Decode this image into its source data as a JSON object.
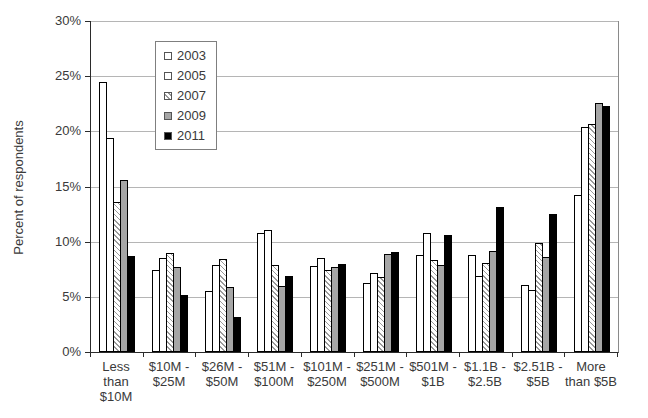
{
  "chart_data": {
    "type": "bar",
    "title": "",
    "xlabel": "",
    "ylabel": "Percent of respondents",
    "ylim": [
      0,
      30
    ],
    "ytick_step": 5,
    "ytick_labels": [
      "0%",
      "5%",
      "10%",
      "15%",
      "20%",
      "25%",
      "30%"
    ],
    "grid": true,
    "legend_position": "upper-left-inside",
    "categories": [
      "Less\nthan\n$10M",
      "$10M -\n$25M",
      "$26M -\n$50M",
      "$51M -\n$100M",
      "$101M -\n$250M",
      "$251M -\n$500M",
      "$501M -\n$1B",
      "$1.1B -\n$2.5B",
      "$2.51B -\n$5B",
      "More\nthan $5B"
    ],
    "series": [
      {
        "name": "2003",
        "fill": "white",
        "values": [
          24.5,
          7.4,
          5.5,
          10.8,
          7.8,
          6.3,
          8.8,
          8.8,
          6.1,
          14.2
        ]
      },
      {
        "name": "2005",
        "fill": "white",
        "values": [
          19.4,
          8.5,
          7.9,
          11.1,
          8.5,
          7.2,
          10.8,
          6.9,
          5.6,
          20.4
        ]
      },
      {
        "name": "2007",
        "fill": "hatch",
        "values": [
          13.6,
          9.0,
          8.4,
          7.9,
          7.4,
          6.8,
          8.3,
          8.1,
          9.9,
          20.7
        ]
      },
      {
        "name": "2009",
        "fill": "gray",
        "values": [
          15.6,
          7.7,
          5.9,
          6.0,
          7.7,
          8.9,
          7.9,
          9.2,
          8.6,
          22.6
        ]
      },
      {
        "name": "2011",
        "fill": "black",
        "values": [
          8.7,
          5.2,
          3.2,
          6.9,
          8.0,
          9.1,
          10.6,
          13.1,
          12.5,
          22.3
        ]
      }
    ],
    "colors": {
      "bar_white": "#ffffff",
      "bar_hatch_line": "#9a9a9a",
      "bar_gray": "#a6a6a6",
      "bar_black": "#000000",
      "bar_border": "#000000",
      "gridline": "#b5b5b5",
      "axis": "#2b2b2b",
      "text": "#3a3a3a"
    }
  }
}
